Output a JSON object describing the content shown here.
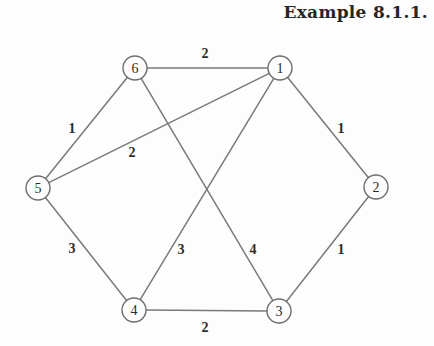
{
  "caption": "Example 8.1.1.",
  "colors": {
    "background": "#fdfdfd",
    "edge_stroke": "#7a7a7a",
    "node_stroke": "#6e6e6e",
    "node_fill": "#fdfdfd",
    "text": "#2b2b2b",
    "caption_text": "#262626"
  },
  "chart_data": {
    "type": "diagram",
    "title": "Example 8.1.1.",
    "subtype": "weighted-undirected-graph",
    "node_radius": 12,
    "nodes": [
      {
        "id": "1",
        "label": "1",
        "x": 280,
        "y": 68
      },
      {
        "id": "2",
        "label": "2",
        "x": 376,
        "y": 187
      },
      {
        "id": "3",
        "label": "3",
        "x": 279,
        "y": 311
      },
      {
        "id": "4",
        "label": "4",
        "x": 134,
        "y": 310
      },
      {
        "id": "5",
        "label": "5",
        "x": 38,
        "y": 188
      },
      {
        "id": "6",
        "label": "6",
        "x": 135,
        "y": 68
      }
    ],
    "edges": [
      {
        "from": "6",
        "to": "1",
        "weight": 2,
        "label": "2",
        "label_x": 205,
        "label_y": 53
      },
      {
        "from": "6",
        "to": "5",
        "weight": 1,
        "label": "1",
        "label_x": 72,
        "label_y": 128
      },
      {
        "from": "5",
        "to": "1",
        "weight": 2,
        "label": "2",
        "label_x": 132,
        "label_y": 152
      },
      {
        "from": "1",
        "to": "2",
        "weight": 1,
        "label": "1",
        "label_x": 341,
        "label_y": 128
      },
      {
        "from": "5",
        "to": "4",
        "weight": 3,
        "label": "3",
        "label_x": 72,
        "label_y": 248
      },
      {
        "from": "1",
        "to": "4",
        "weight": 3,
        "label": "3",
        "label_x": 181,
        "label_y": 249
      },
      {
        "from": "6",
        "to": "3",
        "weight": 4,
        "label": "4",
        "label_x": 253,
        "label_y": 249
      },
      {
        "from": "2",
        "to": "3",
        "weight": 1,
        "label": "1",
        "label_x": 341,
        "label_y": 249
      },
      {
        "from": "4",
        "to": "3",
        "weight": 2,
        "label": "2",
        "label_x": 205,
        "label_y": 327
      }
    ]
  }
}
